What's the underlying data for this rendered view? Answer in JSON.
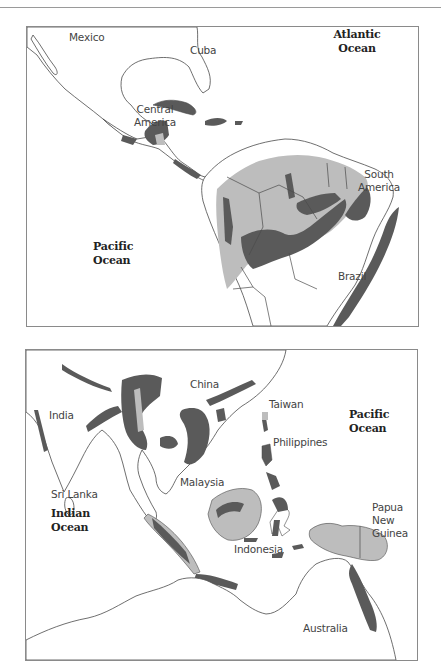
{
  "figure": {
    "colors": {
      "dense_forest": "#5a5a5a",
      "forest": "#bdbdbd",
      "land": "#ffffff",
      "outline": "#4a4a4a",
      "frame": "#8a8a8a"
    },
    "maps": [
      {
        "id": "americas",
        "labels": {
          "mexico": "Mexico",
          "cuba": "Cuba",
          "atlantic_1": "Atlantic",
          "atlantic_2": "Ocean",
          "central_1": "Central",
          "central_2": "America",
          "south_1": "South",
          "south_2": "America",
          "pacific_1": "Pacific",
          "pacific_2": "Ocean",
          "brazil": "Brazil"
        }
      },
      {
        "id": "asia",
        "labels": {
          "china": "China",
          "taiwan": "Taiwan",
          "india": "India",
          "pacific_1": "Pacific",
          "pacific_2": "Ocean",
          "philippines": "Philippines",
          "sri_lanka": "Sri Lanka",
          "malaysia": "Malaysia",
          "indian_1": "Indian",
          "indian_2": "Ocean",
          "png_1": "Papua",
          "png_2": "New",
          "png_3": "Guinea",
          "indonesia": "Indonesia",
          "australia": "Australia"
        }
      }
    ]
  }
}
